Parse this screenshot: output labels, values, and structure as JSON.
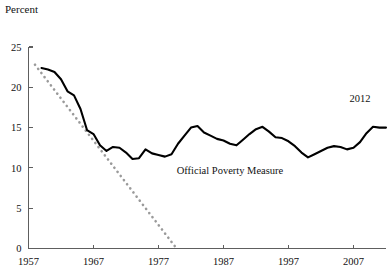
{
  "chart_data": {
    "type": "line",
    "title": "",
    "ylabel": "Percent",
    "xlabel": "",
    "ylim": [
      0,
      25
    ],
    "xlim": [
      1957,
      2012
    ],
    "grid": false,
    "legend": "none",
    "y_ticks": [
      "0",
      "5",
      "10",
      "15",
      "20",
      "25"
    ],
    "y_tick_values": [
      0,
      5,
      10,
      15,
      20,
      25
    ],
    "x_ticks": [
      "1957",
      "1967",
      "1977",
      "1987",
      "1997",
      "2007"
    ],
    "x_tick_values": [
      1957,
      1967,
      1977,
      1987,
      1997,
      2007
    ],
    "annotations": [
      {
        "text": "Official Poverty Measure",
        "x": 1988,
        "y": 9.2
      },
      {
        "text": "2012",
        "x": 2008,
        "y": 18.2
      }
    ],
    "series": [
      {
        "name": "Official Poverty Measure",
        "style": "solid",
        "color": "#000000",
        "x": [
          1959,
          1960,
          1961,
          1962,
          1963,
          1964,
          1965,
          1966,
          1967,
          1968,
          1969,
          1970,
          1971,
          1972,
          1973,
          1974,
          1975,
          1976,
          1977,
          1978,
          1979,
          1980,
          1981,
          1982,
          1983,
          1984,
          1985,
          1986,
          1987,
          1988,
          1989,
          1990,
          1991,
          1992,
          1993,
          1994,
          1995,
          1996,
          1997,
          1998,
          1999,
          2000,
          2001,
          2002,
          2003,
          2004,
          2005,
          2006,
          2007,
          2008,
          2009,
          2010,
          2011,
          2012
        ],
        "values": [
          22.4,
          22.2,
          21.9,
          21.0,
          19.5,
          19.0,
          17.3,
          14.7,
          14.2,
          12.8,
          12.1,
          12.6,
          12.5,
          11.9,
          11.1,
          11.2,
          12.3,
          11.8,
          11.6,
          11.4,
          11.7,
          13.0,
          14.0,
          15.0,
          15.2,
          14.4,
          14.0,
          13.6,
          13.4,
          13.0,
          12.8,
          13.5,
          14.2,
          14.8,
          15.1,
          14.5,
          13.8,
          13.7,
          13.3,
          12.7,
          11.9,
          11.3,
          11.7,
          12.1,
          12.5,
          12.7,
          12.6,
          12.3,
          12.5,
          13.2,
          14.3,
          15.1,
          15.0,
          15.0
        ]
      },
      {
        "name": "Trend (dotted)",
        "style": "dotted",
        "color": "#9a9a9a",
        "x": [
          1958,
          1979.5
        ],
        "values": [
          22.8,
          0.3
        ]
      }
    ]
  }
}
